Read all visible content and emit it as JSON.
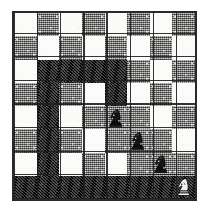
{
  "diagram": {
    "kind": "chess-board-diagram",
    "board_size": 8,
    "files": [
      "a",
      "b",
      "c",
      "d",
      "e",
      "f",
      "g",
      "h"
    ],
    "ranks": [
      "8",
      "7",
      "6",
      "5",
      "4",
      "3",
      "2",
      "1"
    ],
    "colors": {
      "light_square": "#fbfbfa",
      "mid_square": "#9a9a98",
      "dark_square": "#2a2a28",
      "border": "#2b2b2b",
      "page_background": "#ffffff",
      "piece_dark": "#151515",
      "piece_light": "#f2f2f0"
    },
    "shading_legend": {
      "light": "unshaded white square",
      "mid": "halftone grey square",
      "dark": "heavily shaded square (attacked / highlighted region)"
    },
    "squares": [
      [
        "light",
        "mid",
        "light",
        "mid",
        "light",
        "mid",
        "light",
        "mid"
      ],
      [
        "mid",
        "light",
        "mid",
        "light",
        "mid",
        "light",
        "mid",
        "light"
      ],
      [
        "light",
        "dark",
        "dark",
        "dark",
        "dark",
        "mid",
        "light",
        "mid"
      ],
      [
        "mid",
        "dark",
        "mid",
        "light",
        "dark",
        "light",
        "mid",
        "light"
      ],
      [
        "light",
        "dark",
        "light",
        "mid",
        "mid",
        "mid",
        "light",
        "mid"
      ],
      [
        "mid",
        "dark",
        "mid",
        "light",
        "mid",
        "mid",
        "mid",
        "light"
      ],
      [
        "light",
        "dark",
        "light",
        "mid",
        "light",
        "mid",
        "mid",
        "mid"
      ],
      [
        "dark",
        "dark",
        "dark",
        "dark",
        "dark",
        "dark",
        "dark",
        "dark"
      ]
    ],
    "pieces": [
      {
        "id": "knight-1",
        "glyph": "knight",
        "shade": "dark",
        "row": 4,
        "col": 4,
        "square": "e4"
      },
      {
        "id": "knight-2",
        "glyph": "knight",
        "shade": "dark",
        "row": 5,
        "col": 5,
        "square": "f3"
      },
      {
        "id": "knight-3",
        "glyph": "knight",
        "shade": "dark",
        "row": 6,
        "col": 6,
        "square": "g2"
      },
      {
        "id": "knight-4",
        "glyph": "knight",
        "shade": "light",
        "row": 7,
        "col": 7,
        "square": "h1"
      }
    ]
  }
}
